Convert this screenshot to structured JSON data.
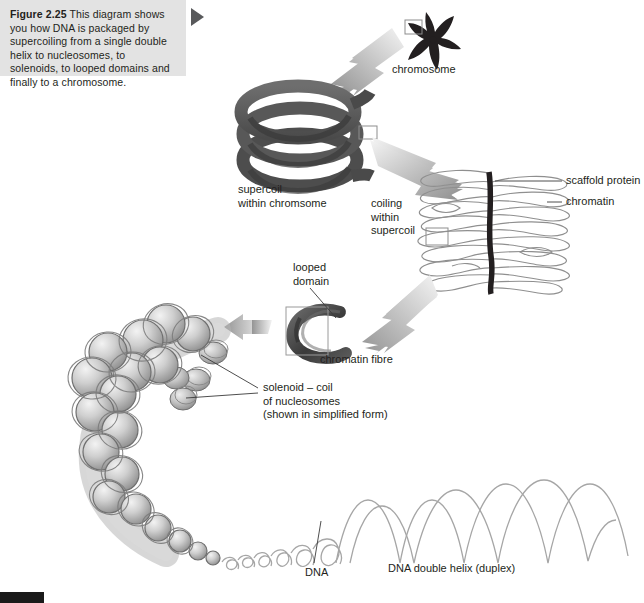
{
  "figure": {
    "number": "Figure 2.25",
    "caption": "This diagram shows you how DNA is packaged by supercoiling from a single double helix to nucleosomes, to solenoids, to looped domains and finally to a chromosome.",
    "caption_bg": "#e3e3e3",
    "marker_icon": "play-triangle-icon",
    "marker_color": "#58595b"
  },
  "labels": {
    "chromosome": "chromosome",
    "supercoil": "supercoil\nwithin chromsome",
    "coiling_within_supercoil": "coiling\nwithin\nsupercoil",
    "scaffold_protein": "scaffold protein",
    "chromatin": "chromatin",
    "looped_domain": "looped\ndomain",
    "chromatin_fibre": "chromatin fibre",
    "solenoid": "solenoid – coil\nof nucleosomes\n(shown in simplified form)",
    "dna": "DNA",
    "dna_double_helix": "DNA double helix (duplex)"
  },
  "colors": {
    "chromosome_dark": "#231f20",
    "supercoil_fill": "#5a5a5a",
    "supercoil_shade": "#3f3f3f",
    "arrow_gradient_from": "#9a9a9a",
    "arrow_gradient_to": "#f2f2f2",
    "chromatin_stroke": "#8a8a8a",
    "scaffold_dark": "#231f20",
    "nucleosome_light": "#e8e8e8",
    "nucleosome_mid": "#b4b4b4",
    "nucleosome_dark": "#8c8c8c",
    "helix_stroke": "#a6a6a6",
    "leader_line": "#3a3a3a",
    "box_outline": "#9a9a9a",
    "text": "#231f20",
    "page_bar": "#1a1a1a"
  },
  "diagram": {
    "stages": [
      "chromosome",
      "supercoil within chromsome",
      "coiling within supercoil / chromatin on scaffold protein",
      "looped domain / chromatin fibre",
      "solenoid – coil of nucleosomes",
      "DNA double helix (duplex)"
    ]
  }
}
